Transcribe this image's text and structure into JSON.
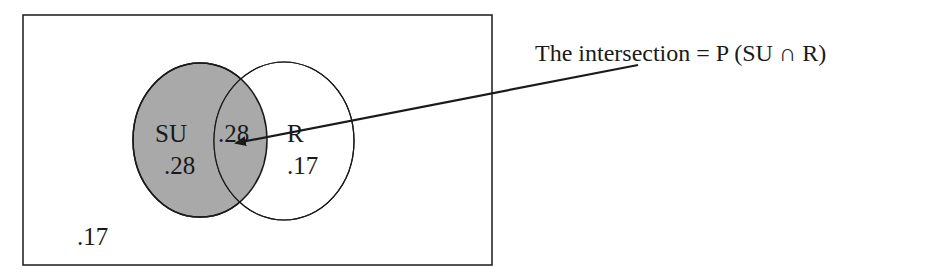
{
  "diagram": {
    "type": "venn",
    "universe_label": ".17",
    "sets": [
      {
        "name": "SU",
        "only_value": ".28",
        "fill": "#a9a9a9"
      },
      {
        "name": "R",
        "only_value": ".17",
        "fill": "#ffffff"
      }
    ],
    "intersection_value": ".28",
    "annotation": "The intersection = P (SU ∩ R)"
  },
  "colors": {
    "stroke": "#1a1a1a",
    "shaded": "#a9a9a9",
    "background": "#ffffff"
  }
}
